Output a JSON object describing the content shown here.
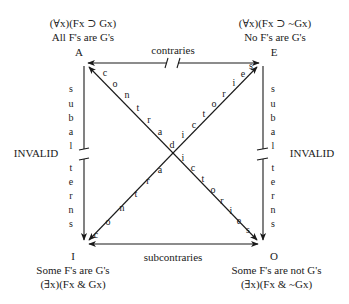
{
  "diagram": {
    "type": "square-of-opposition",
    "corners": {
      "A": {
        "letter": "A",
        "formula": "(∀x)(Fx ⊃ Gx)",
        "english": "All F's are G's"
      },
      "E": {
        "letter": "E",
        "formula": "(∀x)(Fx ⊃ ~Gx)",
        "english": "No F's are G's"
      },
      "I": {
        "letter": "I",
        "english": "Some F's are G's",
        "formula": "(∃x)(Fx & Gx)"
      },
      "O": {
        "letter": "O",
        "english": "Some F's are not G's",
        "formula": "(∃x)(Fx & ~Gx)"
      }
    },
    "relations": {
      "top": "contraries",
      "bottom": "subcontraries",
      "left_vertical": "subalterns",
      "right_vertical": "subalterns",
      "left_status": "INVALID",
      "right_status": "INVALID",
      "diagonal": "contradictories"
    },
    "colors": {
      "line": "#1a1a1a",
      "text": "#1a1a1a",
      "background": "#ffffff"
    }
  }
}
